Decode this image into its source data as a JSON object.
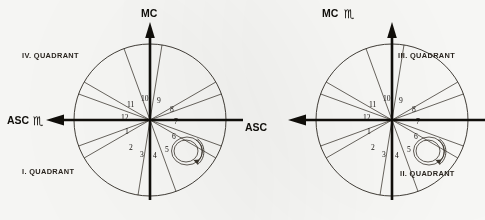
{
  "document": {
    "type": "astrological-house-wheel-pair",
    "background_color": "#fdfdfb",
    "ink_color": "#17140f"
  },
  "charts": [
    {
      "id": "left-chart",
      "center": {
        "x": 150,
        "y": 120
      },
      "radius": 76,
      "axes": {
        "vertical_top_label": "MC",
        "vertical_top_glyph": "",
        "horizontal_left_label": "ASC",
        "horizontal_left_glyph": "♏"
      },
      "quadrants": [
        {
          "id": "quadrant-4",
          "label": "IV. QUADRANT",
          "position": "top-left"
        },
        {
          "id": "quadrant-1",
          "label": "I. QUADRANT",
          "position": "bottom-left"
        }
      ],
      "houses": [
        {
          "number": "1",
          "x": 128,
          "y": 133
        },
        {
          "number": "2",
          "x": 131,
          "y": 149
        },
        {
          "number": "3",
          "x": 142,
          "y": 155
        },
        {
          "number": "4",
          "x": 155,
          "y": 156
        },
        {
          "number": "5",
          "x": 167,
          "y": 150
        },
        {
          "number": "6",
          "x": 174,
          "y": 137
        },
        {
          "number": "7",
          "x": 176,
          "y": 123
        },
        {
          "number": "8",
          "x": 172,
          "y": 110
        },
        {
          "number": "9",
          "x": 160,
          "y": 101
        },
        {
          "number": "10",
          "x": 147,
          "y": 99
        },
        {
          "number": "11",
          "x": 133,
          "y": 104
        },
        {
          "number": "12",
          "x": 126,
          "y": 117
        }
      ],
      "rotation_marker": {
        "id": "spiral-rotation-indicator",
        "x": 188,
        "y": 151,
        "direction": "counter-clockwise"
      }
    },
    {
      "id": "right-chart",
      "center": {
        "x": 392,
        "y": 120
      },
      "radius": 76,
      "axes": {
        "vertical_top_label": "MC",
        "vertical_top_glyph": "♏",
        "horizontal_left_label": "ASC",
        "horizontal_left_glyph": ""
      },
      "quadrants": [
        {
          "id": "quadrant-3",
          "label": "III. QUADRANT",
          "position": "top-right"
        },
        {
          "id": "quadrant-2",
          "label": "II. QUADRANT",
          "position": "bottom-right"
        }
      ],
      "houses": [
        {
          "number": "1",
          "x": 370,
          "y": 133
        },
        {
          "number": "2",
          "x": 373,
          "y": 149
        },
        {
          "number": "3",
          "x": 384,
          "y": 155
        },
        {
          "number": "4",
          "x": 397,
          "y": 156
        },
        {
          "number": "5",
          "x": 409,
          "y": 150
        },
        {
          "number": "6",
          "x": 416,
          "y": 137
        },
        {
          "number": "7",
          "x": 418,
          "y": 123
        },
        {
          "number": "8",
          "x": 414,
          "y": 110
        },
        {
          "number": "9",
          "x": 402,
          "y": 101
        },
        {
          "number": "10",
          "x": 389,
          "y": 99
        },
        {
          "number": "11",
          "x": 375,
          "y": 104
        },
        {
          "number": "12",
          "x": 368,
          "y": 117
        }
      ],
      "rotation_marker": {
        "id": "spiral-rotation-indicator",
        "x": 430,
        "y": 151,
        "direction": "counter-clockwise"
      }
    }
  ],
  "labels": {
    "left": {
      "mc": "MC",
      "asc": "ASC",
      "asc_glyph": "♏",
      "quadrant_iv": "IV. QUADRANT",
      "quadrant_i": "I. QUADRANT",
      "houses": [
        "1",
        "2",
        "3",
        "4",
        "5",
        "6",
        "7",
        "8",
        "9",
        "10",
        "11",
        "12"
      ]
    },
    "right": {
      "mc": "MC",
      "mc_glyph": "♏",
      "asc": "ASC",
      "quadrant_iii": "III. QUADRANT",
      "quadrant_ii": "II. QUADRANT",
      "houses": [
        "1",
        "2",
        "3",
        "4",
        "5",
        "6",
        "7",
        "8",
        "9",
        "10",
        "11",
        "12"
      ]
    }
  }
}
